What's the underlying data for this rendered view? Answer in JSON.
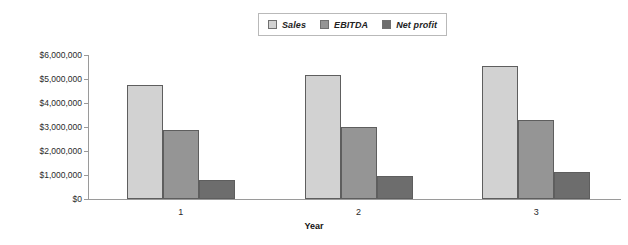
{
  "chart_data": {
    "type": "bar",
    "title": "",
    "subtitle": "",
    "xlabel": "Year",
    "ylabel": "",
    "categories": [
      "1",
      "2",
      "3"
    ],
    "series": [
      {
        "name": "Sales",
        "color": "#d2d2d2",
        "values": [
          4750000,
          5180000,
          5530000
        ]
      },
      {
        "name": "EBITDA",
        "color": "#959595",
        "values": [
          2870000,
          3020000,
          3280000
        ]
      },
      {
        "name": "Net profit",
        "color": "#6d6d6d",
        "values": [
          790000,
          960000,
          1130000
        ]
      }
    ],
    "ylim": [
      0,
      6000000
    ],
    "ytick_values": [
      0,
      1000000,
      2000000,
      3000000,
      4000000,
      5000000,
      6000000
    ],
    "ytick_labels": [
      "$0",
      "$1,000,000",
      "$2,000,000",
      "$3,000,000",
      "$4,000,000",
      "$5,000,000",
      "$6,000,000"
    ],
    "grid": false,
    "legend_position": "top-center",
    "legend_entries": [
      "Sales",
      "EBITDA",
      "Net profit"
    ]
  }
}
